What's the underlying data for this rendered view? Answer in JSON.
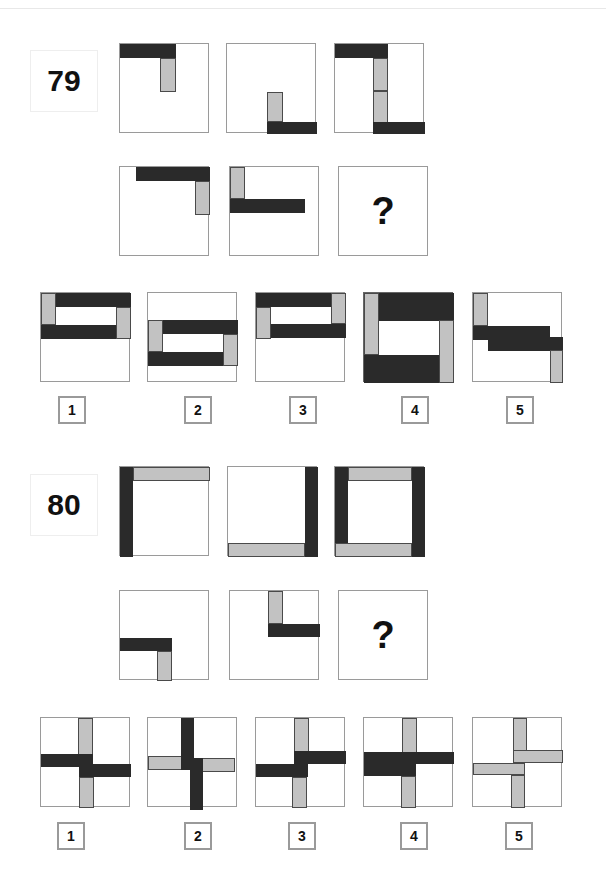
{
  "colors": {
    "dark": "#2a2a2a",
    "light": "#c2c2c2",
    "border": "#9a9a9a"
  },
  "problems": [
    {
      "number": "79",
      "question_mark": "?",
      "number_box": {
        "x": 30,
        "y": 50,
        "w": 66,
        "h": 60
      },
      "sequence": [
        {
          "x": 119,
          "y": 43,
          "bars": [
            {
              "t": "dark",
              "x": 0,
              "y": 0,
              "w": 56,
              "h": 14
            },
            {
              "t": "light",
              "x": 40,
              "y": 14,
              "w": 16,
              "h": 34
            }
          ]
        },
        {
          "x": 226,
          "y": 43,
          "bars": [
            {
              "t": "light",
              "x": 40,
              "y": 48,
              "w": 16,
              "h": 30
            },
            {
              "t": "dark",
              "x": 40,
              "y": 78,
              "w": 50,
              "h": 12
            }
          ]
        },
        {
          "x": 334,
          "y": 43,
          "bars": [
            {
              "t": "dark",
              "x": 0,
              "y": 0,
              "w": 53,
              "h": 14
            },
            {
              "t": "light",
              "x": 38,
              "y": 14,
              "w": 15,
              "h": 33
            },
            {
              "t": "light",
              "x": 38,
              "y": 47,
              "w": 15,
              "h": 32
            },
            {
              "t": "dark",
              "x": 38,
              "y": 78,
              "w": 52,
              "h": 12
            }
          ]
        },
        {
          "x": 119,
          "y": 166,
          "bars": [
            {
              "t": "dark",
              "x": 16,
              "y": 0,
              "w": 74,
              "h": 14
            },
            {
              "t": "light",
              "x": 75,
              "y": 14,
              "w": 15,
              "h": 34
            }
          ]
        },
        {
          "x": 229,
          "y": 166,
          "bars": [
            {
              "t": "light",
              "x": 0,
              "y": 0,
              "w": 15,
              "h": 32
            },
            {
              "t": "dark",
              "x": 0,
              "y": 32,
              "w": 75,
              "h": 14
            }
          ]
        },
        {
          "x": 338,
          "y": 166,
          "question": true,
          "bars": []
        }
      ],
      "options": [
        {
          "label": "1",
          "x": 40,
          "y": 292,
          "lx": 58,
          "ly": 396,
          "bars": [
            {
              "t": "dark",
              "x": 14,
              "y": 0,
              "w": 76,
              "h": 14
            },
            {
              "t": "light",
              "x": 0,
              "y": 0,
              "w": 15,
              "h": 32
            },
            {
              "t": "dark",
              "x": 0,
              "y": 32,
              "w": 76,
              "h": 14
            },
            {
              "t": "light",
              "x": 75,
              "y": 14,
              "w": 15,
              "h": 32
            }
          ]
        },
        {
          "label": "2",
          "x": 147,
          "y": 292,
          "lx": 184,
          "ly": 396,
          "bars": [
            {
              "t": "dark",
              "x": 14,
              "y": 27,
              "w": 76,
              "h": 14
            },
            {
              "t": "light",
              "x": 0,
              "y": 27,
              "w": 15,
              "h": 32
            },
            {
              "t": "dark",
              "x": 0,
              "y": 59,
              "w": 76,
              "h": 14
            },
            {
              "t": "light",
              "x": 75,
              "y": 41,
              "w": 15,
              "h": 32
            }
          ]
        },
        {
          "label": "3",
          "x": 255,
          "y": 292,
          "lx": 289,
          "ly": 396,
          "bars": [
            {
              "t": "dark",
              "x": 0,
              "y": 0,
              "w": 76,
              "h": 14
            },
            {
              "t": "light",
              "x": 75,
              "y": 0,
              "w": 15,
              "h": 31
            },
            {
              "t": "dark",
              "x": 14,
              "y": 31,
              "w": 76,
              "h": 14
            },
            {
              "t": "light",
              "x": 0,
              "y": 14,
              "w": 15,
              "h": 32
            }
          ]
        },
        {
          "label": "4",
          "x": 363,
          "y": 292,
          "lx": 401,
          "ly": 396,
          "thick": true,
          "bars": [
            {
              "t": "dark",
              "x": 14,
              "y": 0,
              "w": 76,
              "h": 28
            },
            {
              "t": "light",
              "x": 0,
              "y": 0,
              "w": 15,
              "h": 62
            },
            {
              "t": "dark",
              "x": 0,
              "y": 62,
              "w": 76,
              "h": 28
            },
            {
              "t": "light",
              "x": 75,
              "y": 27,
              "w": 15,
              "h": 63
            }
          ]
        },
        {
          "label": "5",
          "x": 472,
          "y": 292,
          "lx": 506,
          "ly": 396,
          "bars": [
            {
              "t": "light",
              "x": 0,
              "y": 0,
              "w": 15,
              "h": 33
            },
            {
              "t": "dark",
              "x": 0,
              "y": 33,
              "w": 77,
              "h": 14
            },
            {
              "t": "dark",
              "x": 15,
              "y": 44,
              "w": 62,
              "h": 14
            },
            {
              "t": "dark",
              "x": 77,
              "y": 44,
              "w": 13,
              "h": 13
            },
            {
              "t": "light",
              "x": 77,
              "y": 57,
              "w": 13,
              "h": 33
            }
          ]
        }
      ]
    },
    {
      "number": "80",
      "question_mark": "?",
      "number_box": {
        "x": 30,
        "y": 474,
        "w": 66,
        "h": 60
      },
      "sequence": [
        {
          "x": 119,
          "y": 466,
          "bars": [
            {
              "t": "dark",
              "x": 0,
              "y": 0,
              "w": 13,
              "h": 90
            },
            {
              "t": "light",
              "x": 13,
              "y": 0,
              "w": 77,
              "h": 14
            }
          ]
        },
        {
          "x": 227,
          "y": 466,
          "bars": [
            {
              "t": "dark",
              "x": 77,
              "y": 0,
              "w": 13,
              "h": 90
            },
            {
              "t": "light",
              "x": 0,
              "y": 76,
              "w": 77,
              "h": 14
            }
          ]
        },
        {
          "x": 334,
          "y": 466,
          "bars": [
            {
              "t": "dark",
              "x": 0,
              "y": 0,
              "w": 13,
              "h": 76
            },
            {
              "t": "light",
              "x": 13,
              "y": 0,
              "w": 64,
              "h": 14
            },
            {
              "t": "dark",
              "x": 77,
              "y": 0,
              "w": 13,
              "h": 90
            },
            {
              "t": "light",
              "x": 0,
              "y": 76,
              "w": 77,
              "h": 14
            }
          ]
        },
        {
          "x": 119,
          "y": 590,
          "bars": [
            {
              "t": "dark",
              "x": 0,
              "y": 47,
              "w": 52,
              "h": 13
            },
            {
              "t": "light",
              "x": 37,
              "y": 60,
              "w": 15,
              "h": 30
            }
          ]
        },
        {
          "x": 229,
          "y": 590,
          "bars": [
            {
              "t": "light",
              "x": 38,
              "y": 0,
              "w": 15,
              "h": 33
            },
            {
              "t": "dark",
              "x": 38,
              "y": 33,
              "w": 52,
              "h": 13
            }
          ]
        },
        {
          "x": 338,
          "y": 590,
          "question": true,
          "bars": []
        }
      ],
      "options": [
        {
          "label": "1",
          "x": 40,
          "y": 717,
          "lx": 57,
          "ly": 822,
          "bars": [
            {
              "t": "light",
              "x": 37,
              "y": 0,
              "w": 15,
              "h": 38
            },
            {
              "t": "dark",
              "x": 0,
              "y": 36,
              "w": 52,
              "h": 13
            },
            {
              "t": "dark",
              "x": 38,
              "y": 46,
              "w": 52,
              "h": 13
            },
            {
              "t": "light",
              "x": 38,
              "y": 59,
              "w": 15,
              "h": 31
            }
          ]
        },
        {
          "label": "2",
          "x": 147,
          "y": 717,
          "lx": 184,
          "ly": 822,
          "bars": [
            {
              "t": "light",
              "x": 0,
              "y": 38,
              "w": 34,
              "h": 14
            },
            {
              "t": "light",
              "x": 52,
              "y": 40,
              "w": 35,
              "h": 14
            },
            {
              "t": "dark",
              "x": 33,
              "y": 0,
              "w": 13,
              "h": 52
            },
            {
              "t": "dark",
              "x": 42,
              "y": 40,
              "w": 13,
              "h": 52
            }
          ]
        },
        {
          "label": "3",
          "x": 255,
          "y": 717,
          "lx": 288,
          "ly": 822,
          "bars": [
            {
              "t": "light",
              "x": 38,
              "y": 0,
              "w": 15,
              "h": 35
            },
            {
              "t": "dark",
              "x": 38,
              "y": 33,
              "w": 52,
              "h": 13
            },
            {
              "t": "dark",
              "x": 0,
              "y": 46,
              "w": 52,
              "h": 13
            },
            {
              "t": "light",
              "x": 36,
              "y": 59,
              "w": 15,
              "h": 31
            }
          ]
        },
        {
          "label": "4",
          "x": 363,
          "y": 717,
          "lx": 400,
          "ly": 822,
          "bars": [
            {
              "t": "light",
              "x": 38,
              "y": 0,
              "w": 15,
              "h": 36
            },
            {
              "t": "dark",
              "x": 0,
              "y": 34,
              "w": 90,
              "h": 12
            },
            {
              "t": "dark",
              "x": 0,
              "y": 46,
              "w": 52,
              "h": 12
            },
            {
              "t": "light",
              "x": 37,
              "y": 58,
              "w": 15,
              "h": 32
            }
          ]
        },
        {
          "label": "5",
          "x": 472,
          "y": 717,
          "lx": 505,
          "ly": 822,
          "bars": [
            {
              "t": "light",
              "x": 40,
              "y": 0,
              "w": 14,
              "h": 34
            },
            {
              "t": "light",
              "x": 40,
              "y": 32,
              "w": 50,
              "h": 13
            },
            {
              "t": "light",
              "x": 0,
              "y": 45,
              "w": 52,
              "h": 12
            },
            {
              "t": "light",
              "x": 38,
              "y": 57,
              "w": 14,
              "h": 33
            }
          ]
        }
      ]
    }
  ]
}
